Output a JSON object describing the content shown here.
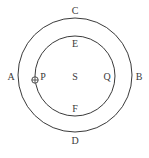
{
  "diagram": {
    "type": "concentric-orbits",
    "outer_circle": {
      "cx": 75,
      "cy": 75,
      "r": 57
    },
    "inner_circle": {
      "cx": 75,
      "cy": 76,
      "r": 40
    },
    "marker": {
      "label": "P",
      "icon": "planet-body-icon",
      "cx": 34,
      "cy": 79,
      "r": 3
    },
    "labels": {
      "A": "A",
      "B": "B",
      "C": "C",
      "D": "D",
      "E": "E",
      "F": "F",
      "P": "P",
      "S": "S",
      "Q": "Q"
    },
    "colors": {
      "stroke": "#3a3a3a",
      "background": "#ffffff"
    }
  }
}
